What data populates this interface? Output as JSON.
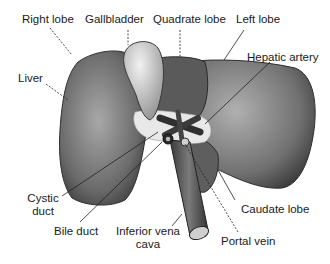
{
  "diagram": {
    "labels": {
      "right_lobe": "Right lobe",
      "gallbladder": "Gallbladder",
      "quadrate_lobe": "Quadrate lobe",
      "left_lobe": "Left lobe",
      "hepatic_artery": "Hepatic artery",
      "liver": "Liver",
      "cystic_duct_1": "Cystic",
      "cystic_duct_2": "duct",
      "bile_duct": "Bile duct",
      "ivc_1": "Inferior vena",
      "ivc_2": "cava",
      "caudate_lobe": "Caudate lobe",
      "portal_vein": "Portal vein"
    },
    "colors": {
      "liver_dark": "#4a4a4a",
      "liver_mid": "#8a8a8a",
      "gallbladder": "#d8d8d8",
      "line": "#222222"
    }
  }
}
